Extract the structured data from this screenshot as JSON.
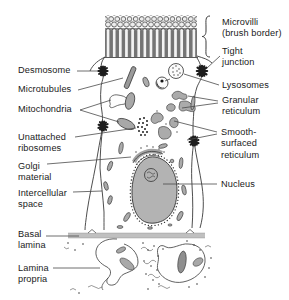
{
  "figure": {
    "type": "biology-cell-diagram",
    "colors": {
      "background": "#ffffff",
      "ink": "#2e2e2e",
      "label_text": "#1a1a1a",
      "leader_line": "#4a4a4a",
      "organelle_fill": "#ababab",
      "nucleus_fill": "#b3b3b3",
      "dark_rod_fill": "#8f8f8f",
      "microvilli_shade": "#8d8d8d"
    }
  },
  "labels": {
    "left": [
      {
        "id": "desmosome",
        "text": "Desmosome"
      },
      {
        "id": "microtubules",
        "text": "Microtubules"
      },
      {
        "id": "mitochondria",
        "text": "Mitochondria"
      },
      {
        "id": "unattached-ribosomes",
        "text": "Unattached\nribosomes"
      },
      {
        "id": "golgi-material",
        "text": "Golgi\nmaterial"
      },
      {
        "id": "intercellular-space",
        "text": "Intercellular\nspace"
      },
      {
        "id": "basal-lamina",
        "text": "Basal\nlamina"
      },
      {
        "id": "lamina-propria",
        "text": "Lamina\npropria"
      }
    ],
    "right": [
      {
        "id": "microvilli",
        "text": "Microvilli\n(brush border)"
      },
      {
        "id": "tight-junction",
        "text": "Tight\njunction"
      },
      {
        "id": "lysosomes",
        "text": "Lysosomes"
      },
      {
        "id": "granular-reticulum",
        "text": "Granular\nreticulum"
      },
      {
        "id": "smooth-surfaced-reticulum",
        "text": "Smooth-\nsurfaced\nreticulum"
      },
      {
        "id": "nucleus",
        "text": "Nucleus"
      }
    ]
  }
}
